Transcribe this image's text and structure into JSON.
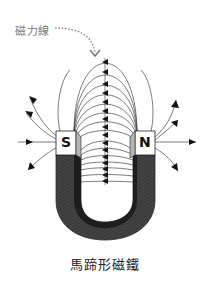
{
  "diagram": {
    "title": "馬蹄形磁鐵",
    "field_line_label": "磁力線",
    "poles": {
      "left": "S",
      "right": "N"
    },
    "colors": {
      "background": "#ffffff",
      "magnet_body": "#3a3a3a",
      "magnet_inner_shadow": "#1e1e1e",
      "pole_face": "#ffffff",
      "pole_bevel": "#b5b5b5",
      "field_line": "#444444",
      "label_text": "#777777",
      "title_text": "#222222"
    }
  }
}
